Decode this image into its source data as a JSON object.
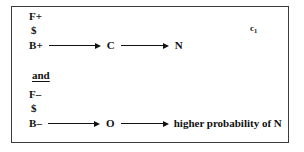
{
  "figure": {
    "condition_label": "c",
    "condition_subscript": "1",
    "connector": "and",
    "top_pathway": {
      "factor_line": "F+",
      "down_arrow_glyph": "$",
      "chain": [
        {
          "label": "B+"
        },
        {
          "label": "C"
        },
        {
          "label": "N"
        }
      ]
    },
    "bottom_pathway": {
      "factor_line": "F–",
      "down_arrow_glyph": "$",
      "chain": [
        {
          "label": "B–"
        },
        {
          "label": "O"
        },
        {
          "label": "higher probability of N"
        }
      ]
    },
    "colors": {
      "ink": "#111111",
      "border": "#3a3a3a",
      "background": "#ffffff"
    }
  }
}
